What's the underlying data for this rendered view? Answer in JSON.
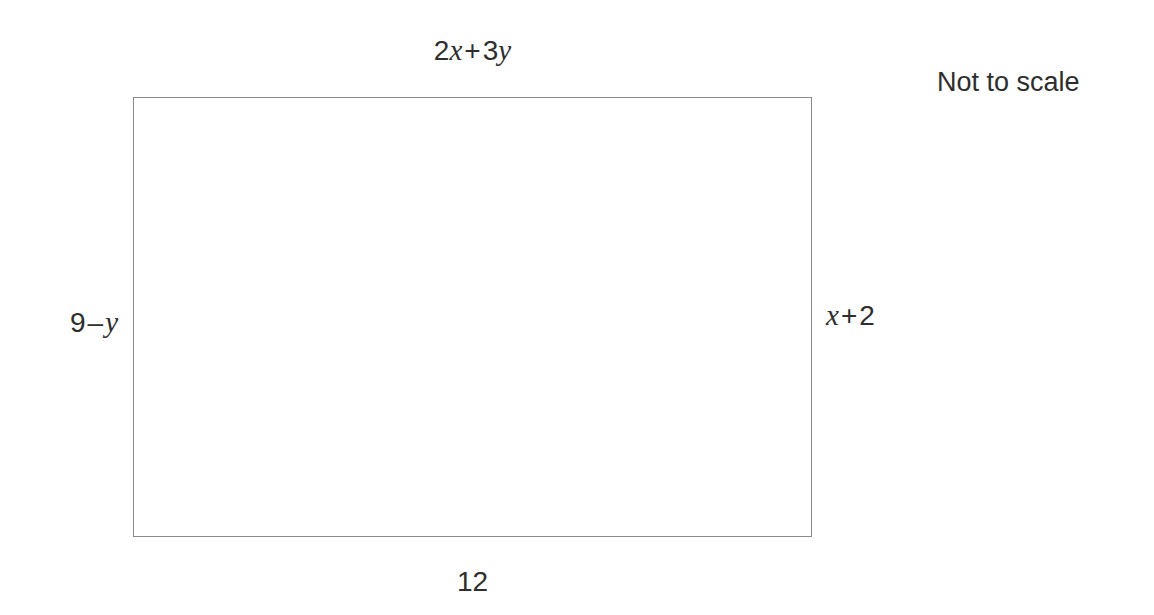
{
  "figure": {
    "shape": "rectangle",
    "note": "Not to scale",
    "stroke_color": "#8a8a8a",
    "text_color": "#2e2e2e",
    "labels": {
      "top": {
        "full_text": "2x + 3y",
        "coefficient_1": "2",
        "variable_1": "x",
        "operator": "+",
        "coefficient_2": "3",
        "variable_2": "y"
      },
      "bottom": {
        "full_text": "12",
        "value": "12"
      },
      "left": {
        "full_text": "9 – y",
        "value": "9",
        "operator": "–",
        "variable": "y"
      },
      "right": {
        "full_text": "x + 2",
        "variable": "x",
        "operator": "+",
        "value": "2"
      }
    }
  }
}
